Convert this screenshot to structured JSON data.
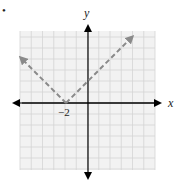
{
  "marker": "•",
  "chart_data": {
    "type": "line",
    "title": "",
    "function": "y = |x + 2|",
    "xlabel": "x",
    "ylabel": "y",
    "xlim": [
      -6,
      6.1
    ],
    "ylim": [
      -6,
      6.5
    ],
    "grid": true,
    "tick_labels": [
      {
        "x": -2,
        "y": 0,
        "label": "−2"
      }
    ],
    "series": [
      {
        "name": "y = |x + 2|",
        "style": "dashed",
        "color": "#8a8a8a",
        "arrows": true,
        "x": [
          -6.1,
          -2,
          4.0
        ],
        "y": [
          4.1,
          0,
          6.0
        ]
      }
    ],
    "vertex": [
      -2,
      0
    ],
    "y_intercept": [
      0,
      2
    ]
  },
  "colors": {
    "axis": "#000000",
    "grid": "#d4d4d4",
    "plot_background": "#f2f2f2",
    "graph_line": "#8a8a8a"
  }
}
